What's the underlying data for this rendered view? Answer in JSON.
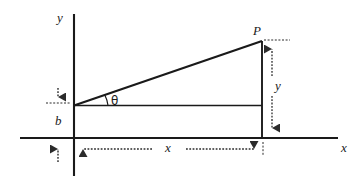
{
  "figure": {
    "type": "geometry-diagram",
    "colors": {
      "stroke": "#1a1a1a",
      "background": "#ffffff",
      "dimension_line": "#2b2b2b"
    },
    "axes": {
      "y_axis_label": "y",
      "x_axis_label": "x",
      "origin_x_px": 74,
      "origin_y_px": 138
    },
    "points": [
      {
        "name": "P",
        "label": "P",
        "x_px": 262,
        "y_px": 41
      }
    ],
    "angles": [
      {
        "name": "theta",
        "label": "θ",
        "vertex_x_px": 74,
        "vertex_y_px": 105
      }
    ],
    "dimensions": [
      {
        "name": "b",
        "label": "b",
        "orientation": "vertical",
        "from_px": 138,
        "to_px": 105
      },
      {
        "name": "y",
        "label": "y",
        "orientation": "vertical",
        "from_px": 41,
        "to_px": 138
      },
      {
        "name": "x",
        "label": "x",
        "orientation": "horizontal",
        "from_px": 74,
        "to_px": 262
      }
    ],
    "lines": [
      {
        "name": "hypotenuse",
        "from": [
          74,
          105
        ],
        "to": [
          262,
          41
        ]
      },
      {
        "name": "base-horizontal",
        "from": [
          74,
          105
        ],
        "to": [
          262,
          105
        ]
      },
      {
        "name": "vertical-drop",
        "from": [
          262,
          41
        ],
        "to": [
          262,
          138
        ]
      }
    ]
  },
  "labels": {
    "y_axis": "y",
    "x_axis": "x",
    "point_p": "P",
    "theta": "θ",
    "intercept_b": "b",
    "rise_y": "y",
    "run_x": "x"
  }
}
